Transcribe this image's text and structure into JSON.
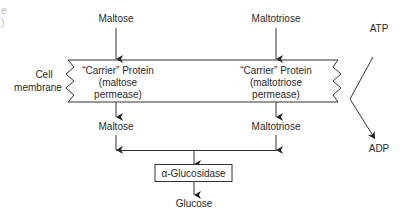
{
  "diagram": {
    "cropped_fragments": [
      "e",
      ")"
    ],
    "inputs": {
      "left": "Maltose",
      "right": "Maltotriose"
    },
    "membrane": {
      "label_line1": "Cell",
      "label_line2": "membrane"
    },
    "carriers": [
      {
        "line1": "“Carrier” Protein",
        "line2": "(maltose",
        "line3": "permease)"
      },
      {
        "line1": "“Carrier” Protein",
        "line2": "(maltotriose",
        "line3": "permease)"
      }
    ],
    "inside": {
      "left": "Maltose",
      "right": "Maltotriose"
    },
    "enzyme": "α-Glucosidase",
    "product": "Glucose",
    "energy": {
      "input": "ATP",
      "output": "ADP"
    },
    "colors": {
      "line": "#333333",
      "text": "#2a2a2a",
      "background": "#ffffff"
    }
  }
}
